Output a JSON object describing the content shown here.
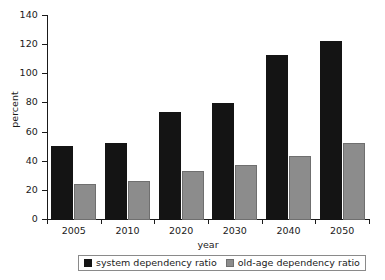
{
  "chart_data": {
    "type": "bar",
    "title": "",
    "xlabel": "year",
    "ylabel": "percent",
    "categories": [
      "2005",
      "2010",
      "2020",
      "2030",
      "2040",
      "2050"
    ],
    "series": [
      {
        "name": "system dependency ratio",
        "color": "#141414",
        "values": [
          51,
          53,
          74,
          80,
          113,
          123
        ]
      },
      {
        "name": "old-age dependency ratio",
        "color": "#8c8c8c",
        "values": [
          25,
          26.5,
          33.5,
          38,
          44,
          53
        ]
      }
    ],
    "ylim": [
      0,
      140
    ],
    "yticks": [
      0,
      20,
      40,
      60,
      80,
      100,
      120,
      140
    ],
    "ytick_labels": [
      "0",
      "20",
      "40",
      "60",
      "80",
      "100",
      "120",
      "140"
    ],
    "grid": false,
    "legend_position": "bottom"
  },
  "legend": {
    "entries": [
      {
        "label": "system dependency ratio",
        "swatch": "black-square-icon"
      },
      {
        "label": "old-age dependency ratio",
        "swatch": "gray-square-icon"
      }
    ]
  }
}
